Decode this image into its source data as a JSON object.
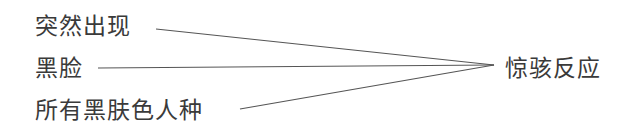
{
  "diagram": {
    "inputs": [
      {
        "label": "突然出现"
      },
      {
        "label": "黑脸"
      },
      {
        "label": "所有黑肤色人种"
      }
    ],
    "output": {
      "label": "惊骇反应"
    },
    "line_color": "#555555",
    "text_color": "#3a3a3a"
  }
}
